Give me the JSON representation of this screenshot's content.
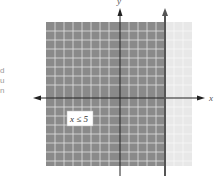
{
  "left_text_fragments": [
    "d",
    "u",
    "n"
  ],
  "graph": {
    "x_axis_label": "x",
    "y_axis_label": "y",
    "inequality_label": "x ≤ 5",
    "boundary_value": 5,
    "grid_range": [
      -8,
      8
    ],
    "colors": {
      "shaded": "#8a8a8a",
      "unshaded": "#e8e8e8",
      "grid_line": "#ffffff",
      "axis": "#222222",
      "boundary": "#555555"
    }
  }
}
